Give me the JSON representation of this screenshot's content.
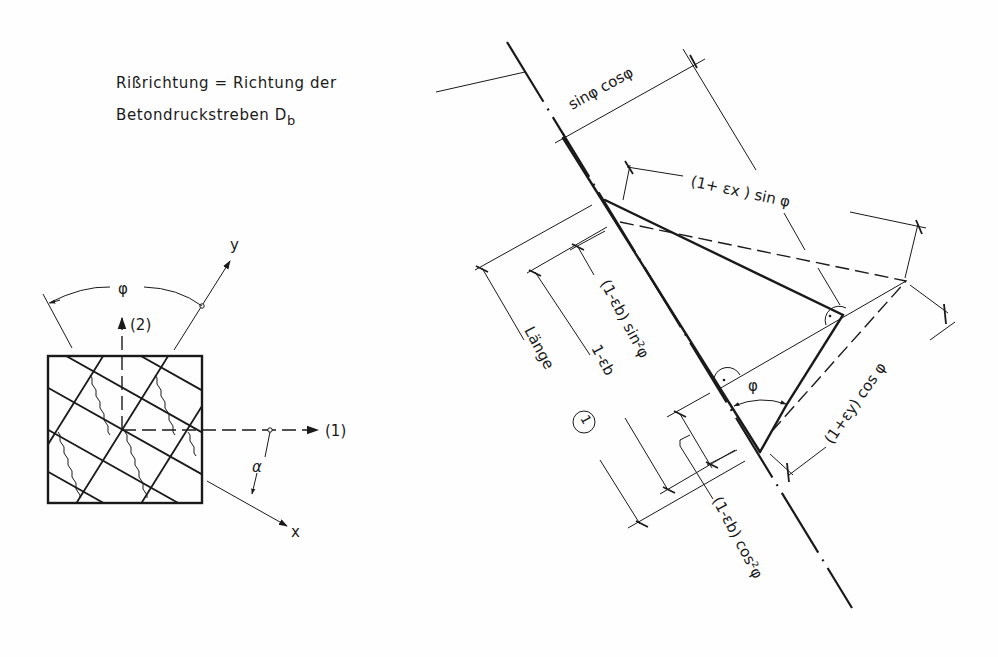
{
  "caption": {
    "line1": "Rißrichtung = Richtung der",
    "line2_main": "Betondruckstreben D",
    "line2_sub": "b"
  },
  "element_sketch": {
    "axis_y": "y",
    "axis_x": "x",
    "axis_1": "(1)",
    "axis_2": "(2)",
    "angle_phi": "φ",
    "angle_alpha": "α"
  },
  "deformation_diagram": {
    "dim_top": "sinφ cosφ",
    "dim_ex": "(1+ εx ) sin φ",
    "dim_ey": "(1+εy) cos φ",
    "dim_sin2": "(1-εb) sin²φ",
    "dim_cos2": "(1-εb) cos²φ",
    "dim_1_minus_eb": "1-εb",
    "dim_laenge": "Länge",
    "circled_one": "1",
    "angle_phi": "φ"
  },
  "colors": {
    "ink": "#1a1a1a",
    "paper": "#fefefe"
  }
}
